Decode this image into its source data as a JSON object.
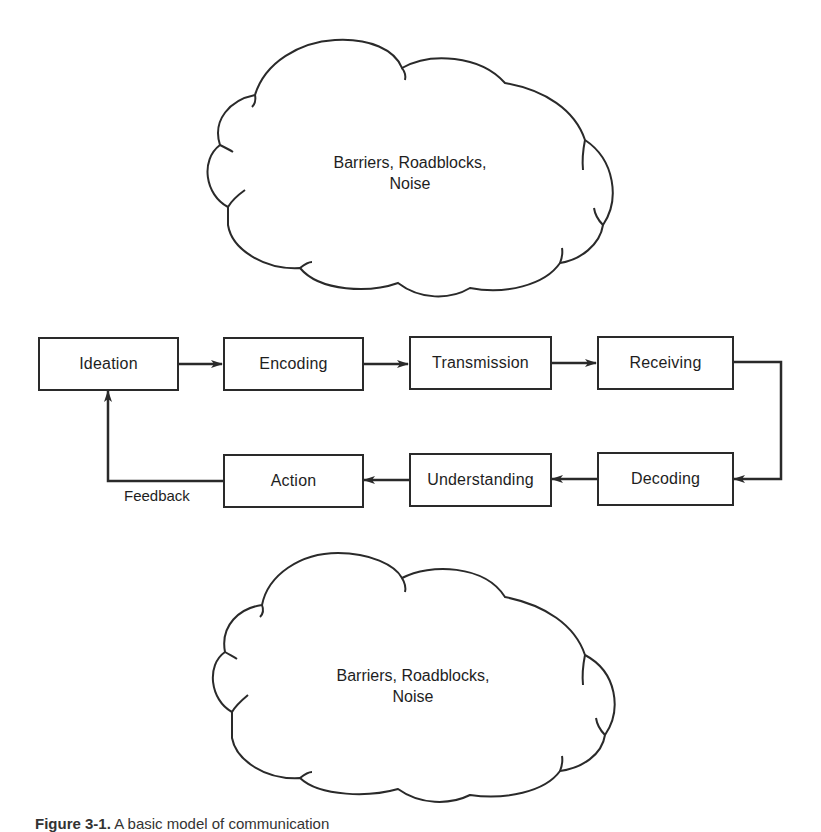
{
  "diagram": {
    "title": "Basic model of communication",
    "clouds": [
      {
        "id": "top",
        "label_line1": "Barriers, Roadblocks,",
        "label_line2": "Noise"
      },
      {
        "id": "bottom",
        "label_line1": "Barriers, Roadblocks,",
        "label_line2": "Noise"
      }
    ],
    "nodes": [
      {
        "id": "ideation",
        "label": "Ideation"
      },
      {
        "id": "encoding",
        "label": "Encoding"
      },
      {
        "id": "transmission",
        "label": "Transmission"
      },
      {
        "id": "receiving",
        "label": "Receiving"
      },
      {
        "id": "decoding",
        "label": "Decoding"
      },
      {
        "id": "understanding",
        "label": "Understanding"
      },
      {
        "id": "action",
        "label": "Action"
      }
    ],
    "edges": [
      {
        "from": "ideation",
        "to": "encoding"
      },
      {
        "from": "encoding",
        "to": "transmission"
      },
      {
        "from": "transmission",
        "to": "receiving"
      },
      {
        "from": "receiving",
        "to": "decoding"
      },
      {
        "from": "decoding",
        "to": "understanding"
      },
      {
        "from": "understanding",
        "to": "action"
      },
      {
        "from": "action",
        "to": "ideation",
        "label": "Feedback"
      }
    ],
    "feedback_label": "Feedback",
    "stroke_color": "#2a2a2a"
  },
  "caption": {
    "figure_number": "Figure 3-1.",
    "text": "A basic model of communication"
  }
}
